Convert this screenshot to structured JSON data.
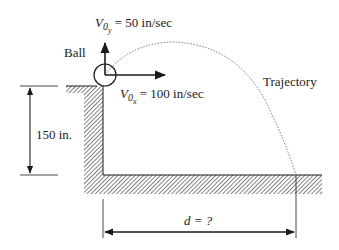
{
  "diagram": {
    "ball_label": "Ball",
    "vy_label": {
      "symbol": "V",
      "sub": "0",
      "subsub": "y",
      "value": " = 50 in/sec"
    },
    "vx_label": {
      "symbol": "V",
      "sub": "0",
      "subsub": "x",
      "value": " = 100 in/sec"
    },
    "trajectory_label": "Trajectory",
    "height_label": "150 in.",
    "distance_label": {
      "var": "d",
      "value": " = ?"
    }
  },
  "colors": {
    "ink": "#1a1a1a",
    "trajectory": "#555555",
    "background": "#ffffff"
  }
}
